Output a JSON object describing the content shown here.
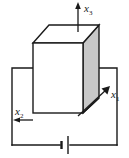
{
  "figure": {
    "name": "piezoelectric-block-circuit-diagram",
    "background_color": "#ffffff",
    "line_color": "#1a1a1a",
    "shade_color": "#c8c8c8",
    "face_color": "#ffffff",
    "axes": [
      {
        "id": "x1",
        "symbol": "x",
        "subscript": "1",
        "label": "x1",
        "direction": "up-right-diagonal"
      },
      {
        "id": "x2",
        "symbol": "x",
        "subscript": "2",
        "label": "x2",
        "direction": "left"
      },
      {
        "id": "x3",
        "symbol": "x",
        "subscript": "3",
        "label": "x3",
        "direction": "up"
      }
    ],
    "components": [
      {
        "id": "block",
        "label": "rectangular block"
      },
      {
        "id": "battery",
        "label": "battery"
      },
      {
        "id": "wire-left",
        "label": "left wire"
      },
      {
        "id": "wire-right",
        "label": "right wire"
      },
      {
        "id": "wire-bottom",
        "label": "bottom wire"
      }
    ]
  }
}
